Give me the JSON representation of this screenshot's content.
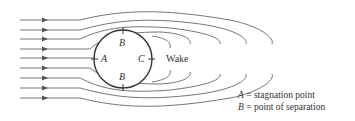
{
  "diagram": {
    "labels": {
      "A": "A",
      "B_top": "B",
      "B_bottom": "B",
      "C": "C",
      "wake": "Wake"
    },
    "legend": [
      {
        "symbol": "A",
        "equals": " = ",
        "text": "stagnation point"
      },
      {
        "symbol": "B",
        "equals": " = ",
        "text": "point of separation"
      }
    ],
    "colors": {
      "stroke": "#555555",
      "circle": "#333333",
      "text": "#333333"
    }
  }
}
